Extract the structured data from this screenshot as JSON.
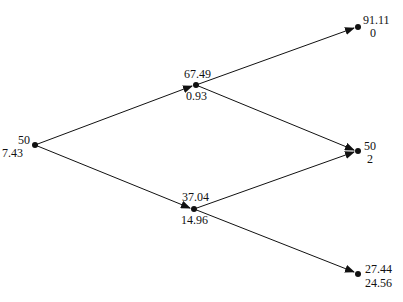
{
  "diagram": {
    "type": "binomial-tree",
    "nodes": [
      {
        "id": "root",
        "price": "50",
        "value": "7.43"
      },
      {
        "id": "up",
        "price": "67.49",
        "value": "0.93"
      },
      {
        "id": "down",
        "price": "37.04",
        "value": "14.96"
      },
      {
        "id": "upup",
        "price": "91.11",
        "value": "0"
      },
      {
        "id": "updown",
        "price": "50",
        "value": "2"
      },
      {
        "id": "downdown",
        "price": "27.44",
        "value": "24.56"
      }
    ],
    "edges": [
      {
        "from": "root",
        "to": "up"
      },
      {
        "from": "root",
        "to": "down"
      },
      {
        "from": "up",
        "to": "upup"
      },
      {
        "from": "up",
        "to": "updown"
      },
      {
        "from": "down",
        "to": "updown"
      },
      {
        "from": "down",
        "to": "downdown"
      }
    ]
  }
}
